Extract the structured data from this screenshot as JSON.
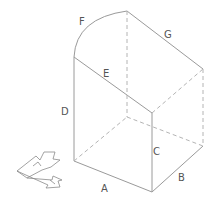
{
  "diagram": {
    "type": "isometric-solid",
    "colors": {
      "edge": "#9a9a9a",
      "hidden": "#b4b4b4",
      "label": "#555555"
    },
    "labels": {
      "A": "A",
      "B": "B",
      "C": "C",
      "D": "D",
      "E": "E",
      "F": "F",
      "G": "G"
    },
    "axis_icon": "orientation-arrows-icon"
  }
}
